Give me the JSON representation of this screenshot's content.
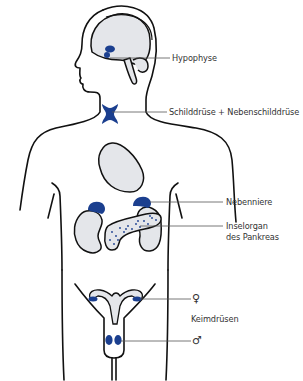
{
  "diagram": {
    "colors": {
      "outline": "#111111",
      "organ_fill": "#e4e6ea",
      "gland_blue": "#1b3f8f",
      "leader_line": "#555555",
      "label_text": "#333333"
    },
    "labels": {
      "hypophyse": "Hypophyse",
      "schilddruese": "Schilddrüse + Nebenschilddrüse",
      "nebenniere": "Nebenniere",
      "inselorgan_line1": "Inselorgan",
      "inselorgan_line2": "des Pankreas",
      "female_symbol": "♀",
      "keimdruesen": "Keimdrüsen",
      "male_symbol": "♂"
    }
  }
}
